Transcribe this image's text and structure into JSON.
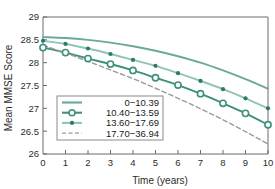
{
  "chart_data": {
    "type": "line",
    "title": "",
    "xlabel": "Time (years)",
    "ylabel": "Mean MMSE Score",
    "xlim": [
      0,
      10
    ],
    "ylim": [
      26,
      29
    ],
    "grid": false,
    "legend_position": "lower-left-inside",
    "x": [
      0,
      1,
      2,
      3,
      4,
      5,
      6,
      7,
      8,
      9,
      10
    ],
    "xticks": [
      "0",
      "1",
      "2",
      "3",
      "4",
      "5",
      "6",
      "7",
      "8",
      "9",
      "10"
    ],
    "yticks": [
      "26",
      "26.5",
      "27",
      "27.5",
      "28",
      "28.5",
      "29"
    ],
    "series": [
      {
        "name": "0−10.39",
        "color": "#6aa89b",
        "style": "solid",
        "marker": "none",
        "values": [
          28.56,
          28.54,
          28.5,
          28.44,
          28.36,
          28.26,
          28.14,
          28.0,
          27.83,
          27.64,
          27.43
        ]
      },
      {
        "name": "10.40−13.59",
        "color": "#3f8f7d",
        "style": "solid",
        "marker": "open-circle",
        "values": [
          28.33,
          28.22,
          28.09,
          27.97,
          27.83,
          27.67,
          27.51,
          27.32,
          27.11,
          26.89,
          26.64
        ]
      },
      {
        "name": "13.60−17.69",
        "color": "#8fc4b6",
        "style": "solid",
        "marker": "filled-circle",
        "values": [
          28.48,
          28.41,
          28.31,
          28.19,
          28.06,
          27.93,
          27.77,
          27.6,
          27.42,
          27.22,
          27.0
        ]
      },
      {
        "name": "17.70−36.94",
        "color": "#9a9a9a",
        "style": "dashed",
        "marker": "none",
        "values": [
          28.38,
          28.21,
          28.03,
          27.84,
          27.65,
          27.44,
          27.22,
          26.99,
          26.75,
          26.49,
          26.22
        ]
      }
    ]
  }
}
